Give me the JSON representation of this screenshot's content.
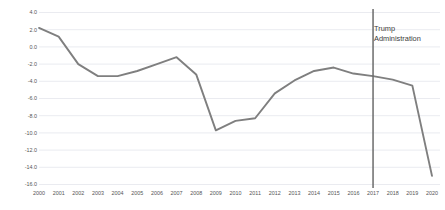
{
  "chart_data": {
    "type": "line",
    "title": "",
    "xlabel": "",
    "ylabel": "",
    "x": [
      2000,
      2001,
      2002,
      2003,
      2004,
      2005,
      2006,
      2007,
      2008,
      2009,
      2010,
      2011,
      2012,
      2013,
      2014,
      2015,
      2016,
      2017,
      2018,
      2019,
      2020
    ],
    "categories": [
      "2000",
      "2001",
      "2002",
      "2003",
      "2004",
      "2005",
      "2006",
      "2007",
      "2008",
      "2009",
      "2010",
      "2011",
      "2012",
      "2013",
      "2014",
      "2015",
      "2016",
      "2017",
      "2018",
      "2019",
      "2020"
    ],
    "values": [
      2.2,
      1.2,
      -2.0,
      -3.4,
      -3.4,
      -2.8,
      -2.0,
      -1.2,
      -3.2,
      -9.7,
      -8.6,
      -8.3,
      -5.4,
      -3.9,
      -2.8,
      -2.4,
      -3.1,
      -3.4,
      -3.8,
      -4.5,
      -15.0
    ],
    "series": [
      {
        "name": "",
        "values": [
          2.2,
          1.2,
          -2.0,
          -3.4,
          -3.4,
          -2.8,
          -2.0,
          -1.2,
          -3.2,
          -9.7,
          -8.6,
          -8.3,
          -5.4,
          -3.9,
          -2.8,
          -2.4,
          -3.1,
          -3.4,
          -3.8,
          -4.5,
          -15.0
        ],
        "color": "#7f7f7f"
      }
    ],
    "ylim": [
      -16.0,
      4.0
    ],
    "y_ticks": [
      4.0,
      2.0,
      0.0,
      -2.0,
      -4.0,
      -6.0,
      -8.0,
      -10.0,
      -12.0,
      -14.0,
      -16.0
    ],
    "y_tick_labels": [
      "4.0",
      "2.0",
      "0.0",
      "-2.0",
      "-4.0",
      "-6.0",
      "-8.0",
      "-10.0",
      "-12.0",
      "-14.0",
      "-16.0"
    ],
    "x_tick_labels": [
      "2000",
      "2001",
      "2002",
      "2003",
      "2004",
      "2005",
      "2006",
      "2007",
      "2008",
      "2009",
      "2010",
      "2011",
      "2012",
      "2013",
      "2014",
      "2015",
      "2016",
      "2017",
      "2018",
      "2019",
      "2020"
    ],
    "grid": true,
    "grid_axis": "y",
    "grid_color": "#e4e6ec",
    "legend": false,
    "legend_position": "none",
    "annotations": [
      {
        "name": "trump-administration",
        "line1": "Trump",
        "line2": "Administration",
        "text": "Trump Administration",
        "x_value": 2017,
        "type": "vertical-line-with-label",
        "color": "#6b6b6b"
      }
    ],
    "background_color": "#ffffff",
    "text_color": "#555555"
  }
}
